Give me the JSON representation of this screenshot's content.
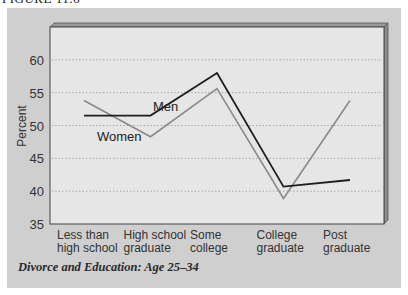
{
  "figure_label": "FIGURE 11.6",
  "caption": "Divorce and Education: Age 25–34",
  "colors": {
    "men": "#1e1e1e",
    "women": "#8a8a8a",
    "plot_bg": "#e6e6e6",
    "panel_bg": "#cfcfcf",
    "grid": "#9a9a9a"
  },
  "chart_data": {
    "type": "line",
    "title": "Divorce and Education: Age 25–34",
    "xlabel": "",
    "ylabel": "Percent",
    "ylim": [
      35,
      65
    ],
    "yticks": [
      35,
      40,
      45,
      50,
      55,
      60
    ],
    "grid": true,
    "grid_style": "dotted",
    "categories": [
      [
        "Less than",
        "high school"
      ],
      [
        "High school",
        "graduate"
      ],
      [
        "Some",
        "college"
      ],
      [
        "College",
        "graduate"
      ],
      [
        "Post",
        "graduate"
      ]
    ],
    "series": [
      {
        "name": "Men",
        "values": [
          51.5,
          51.5,
          58.0,
          40.7,
          41.7
        ]
      },
      {
        "name": "Women",
        "values": [
          53.8,
          48.3,
          55.6,
          38.9,
          53.8
        ]
      }
    ],
    "legend": "inline-labels"
  }
}
